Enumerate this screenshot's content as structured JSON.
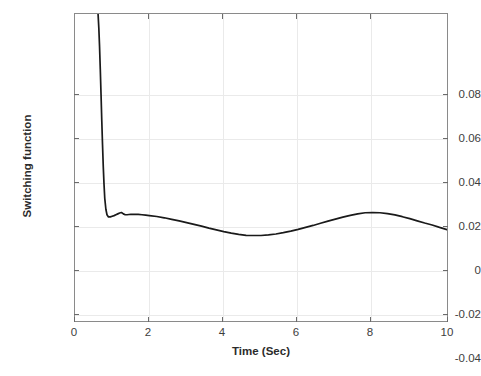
{
  "chart_data": {
    "type": "line",
    "title": "",
    "subtitle": "",
    "xlabel": "Time (Sec)",
    "ylabel": "Switching function",
    "xlim": [
      0,
      10
    ],
    "ylim": [
      -0.0436,
      0.0968
    ],
    "xticks": [
      0,
      2,
      4,
      6,
      8,
      10
    ],
    "xtick_labels": [
      "0",
      "2",
      "4",
      "6",
      "8",
      "10"
    ],
    "yticks": [
      0.08,
      0.06,
      0.04,
      0.02,
      0,
      -0.02,
      -0.04
    ],
    "ytick_labels": [
      "0.08",
      "0.06",
      "0.04",
      "0.02",
      "0",
      "-0.02",
      "-0.04"
    ],
    "grid": true,
    "legend": null,
    "series": [
      {
        "name": "Switching function",
        "color": "#1a1a1a",
        "line_width": 1.6,
        "x": [
          0.62,
          0.64,
          0.66,
          0.68,
          0.7,
          0.72,
          0.74,
          0.76,
          0.78,
          0.8,
          0.83,
          0.86,
          0.9,
          0.95,
          1.0,
          1.05,
          1.1,
          1.15,
          1.2,
          1.25,
          1.3,
          1.35,
          1.4,
          1.45,
          1.5,
          1.6,
          1.7,
          1.8,
          1.9,
          2.0,
          2.2,
          2.4,
          2.6,
          2.8,
          3.0,
          3.2,
          3.4,
          3.6,
          3.8,
          4.0,
          4.2,
          4.4,
          4.6,
          4.8,
          5.0,
          5.2,
          5.4,
          5.6,
          5.8,
          6.0,
          6.2,
          6.4,
          6.6,
          6.8,
          7.0,
          7.2,
          7.4,
          7.6,
          7.8,
          8.0,
          8.2,
          8.4,
          8.6,
          8.8,
          9.0,
          9.2,
          9.4,
          9.6,
          9.8,
          10.0
        ],
        "y": [
          0.0968,
          0.0905,
          0.082,
          0.0715,
          0.06,
          0.048,
          0.037,
          0.027,
          0.019,
          0.0125,
          0.0075,
          0.005,
          0.004,
          0.004,
          0.0043,
          0.0046,
          0.005,
          0.0054,
          0.0058,
          0.006,
          0.0054,
          0.005,
          0.005,
          0.0051,
          0.0052,
          0.0052,
          0.0052,
          0.005,
          0.0048,
          0.0046,
          0.0042,
          0.0036,
          0.0029,
          0.0022,
          0.0014,
          0.0006,
          -0.0002,
          -0.0011,
          -0.0019,
          -0.0027,
          -0.0034,
          -0.004,
          -0.0044,
          -0.0045,
          -0.0045,
          -0.0042,
          -0.0038,
          -0.0032,
          -0.0025,
          -0.0017,
          -0.0008,
          0.0001,
          0.0011,
          0.0021,
          0.003,
          0.0039,
          0.0047,
          0.0054,
          0.0059,
          0.006,
          0.0059,
          0.0055,
          0.0049,
          0.0041,
          0.0032,
          0.0022,
          0.0012,
          0.0003,
          -0.0008,
          -0.0018
        ]
      }
    ],
    "annotations": []
  },
  "axes": {
    "x_title": "Time (Sec)",
    "y_title": "Switching function"
  }
}
